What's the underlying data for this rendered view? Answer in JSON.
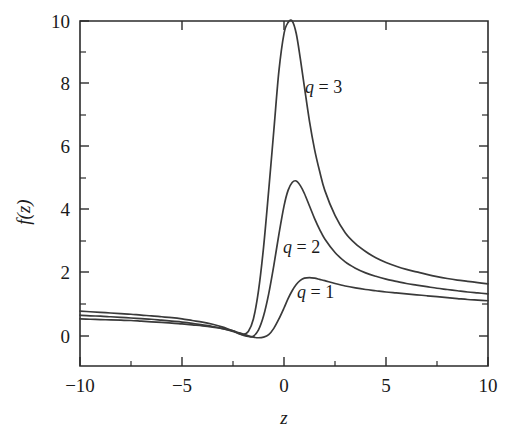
{
  "chart_data": {
    "type": "line",
    "title": "",
    "subtitle": "",
    "xlabel": "z",
    "ylabel": "f(z)",
    "xlim": [
      -10,
      10
    ],
    "ylim": [
      -1,
      10
    ],
    "grid": false,
    "legend_position": "inline-annotations",
    "x_ticks_major": [
      -10,
      -5,
      0,
      5,
      10
    ],
    "x_tick_labels": [
      "−10",
      "−5",
      "0",
      "5",
      "10"
    ],
    "x_ticks_minor": [
      -7.5,
      -2.5,
      2.5,
      7.5
    ],
    "y_ticks_major": [
      0,
      2,
      4,
      6,
      8,
      10
    ],
    "y_tick_labels": [
      "0",
      "2",
      "4",
      "6",
      "8",
      "10"
    ],
    "y_ticks_minor": [
      1,
      3,
      5,
      7,
      9
    ],
    "axis_color": "#2b2b2b",
    "curve_color": "#3a3a3a",
    "background_color": "#ffffff",
    "x": [
      -10,
      -9.5,
      -9,
      -8.5,
      -8,
      -7.5,
      -7,
      -6.5,
      -6,
      -5.5,
      -5,
      -4.5,
      -4,
      -3.5,
      -3,
      -2.5,
      -2.25,
      -2,
      -1.75,
      -1.5,
      -1.25,
      -1,
      -0.75,
      -0.5,
      -0.25,
      0,
      0.2,
      0.4,
      0.6,
      0.8,
      1,
      1.25,
      1.5,
      1.75,
      2,
      2.5,
      3,
      3.5,
      4,
      4.5,
      5,
      5.5,
      6,
      6.5,
      7,
      7.5,
      8,
      8.5,
      9,
      9.5,
      10
    ],
    "series": [
      {
        "name": "q = 3",
        "label": "q = 3",
        "q": 3,
        "peak_x": 0.4,
        "peak_y": 10,
        "value_at_x_min": 0.75,
        "value_at_x_max": 1.62,
        "values": [
          0.75,
          0.73,
          0.71,
          0.69,
          0.67,
          0.65,
          0.62,
          0.6,
          0.57,
          0.54,
          0.5,
          0.45,
          0.4,
          0.33,
          0.24,
          0.12,
          0.05,
          0.0,
          0.1,
          0.5,
          1.4,
          2.8,
          4.6,
          6.5,
          8.4,
          9.6,
          9.95,
          10.0,
          9.6,
          8.8,
          7.9,
          6.8,
          5.9,
          5.2,
          4.6,
          3.8,
          3.25,
          2.9,
          2.65,
          2.45,
          2.3,
          2.18,
          2.08,
          2.0,
          1.92,
          1.85,
          1.79,
          1.74,
          1.7,
          1.66,
          1.62
        ]
      },
      {
        "name": "q = 2",
        "label": "q = 2",
        "q": 2,
        "peak_x": 0.55,
        "peak_y": 4.9,
        "value_at_x_min": 0.62,
        "value_at_x_max": 1.3,
        "values": [
          0.62,
          0.6,
          0.59,
          0.57,
          0.55,
          0.53,
          0.51,
          0.49,
          0.46,
          0.43,
          0.4,
          0.36,
          0.31,
          0.26,
          0.19,
          0.1,
          0.04,
          -0.02,
          -0.06,
          -0.05,
          0.15,
          0.6,
          1.3,
          2.2,
          3.2,
          4.1,
          4.6,
          4.85,
          4.9,
          4.75,
          4.5,
          4.1,
          3.7,
          3.35,
          3.05,
          2.62,
          2.32,
          2.12,
          1.97,
          1.86,
          1.77,
          1.7,
          1.63,
          1.58,
          1.53,
          1.48,
          1.44,
          1.4,
          1.36,
          1.33,
          1.3
        ]
      },
      {
        "name": "q = 1",
        "label": "q = 1",
        "q": 1,
        "peak_x": 1.0,
        "peak_y": 1.8,
        "value_at_x_min": 0.5,
        "value_at_x_max": 1.08,
        "values": [
          0.5,
          0.49,
          0.48,
          0.47,
          0.46,
          0.45,
          0.43,
          0.41,
          0.39,
          0.37,
          0.34,
          0.31,
          0.28,
          0.24,
          0.19,
          0.12,
          0.07,
          0.02,
          -0.04,
          -0.08,
          -0.1,
          -0.08,
          0.0,
          0.2,
          0.5,
          0.85,
          1.15,
          1.4,
          1.6,
          1.73,
          1.8,
          1.82,
          1.8,
          1.76,
          1.72,
          1.63,
          1.55,
          1.49,
          1.44,
          1.4,
          1.36,
          1.33,
          1.3,
          1.27,
          1.24,
          1.21,
          1.18,
          1.15,
          1.12,
          1.1,
          1.08
        ]
      }
    ],
    "annotations": [
      {
        "text": "q = 3",
        "var": "q",
        "rest": " = 3",
        "x_px": 305,
        "y_px": 93
      },
      {
        "text": "q = 2",
        "var": "q",
        "rest": " = 2",
        "x_px": 283,
        "y_px": 253
      },
      {
        "text": "q = 1",
        "var": "q",
        "rest": " = 1",
        "x_px": 297,
        "y_px": 298
      }
    ]
  }
}
